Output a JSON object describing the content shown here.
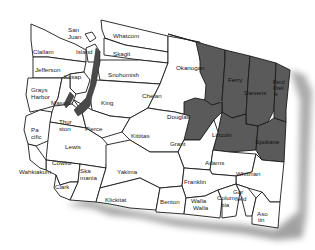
{
  "map": {
    "title": "Washington State Counties",
    "colors": {
      "highlighted": "#5a5a5a",
      "default": "#ffffff",
      "border": "#1a1a1a",
      "water": "#4a4a4a",
      "shadow": "#8a8a8a"
    },
    "highlighted_counties": [
      "Okanogan",
      "Ferry",
      "Stevens",
      "Pend Oreille",
      "Douglas",
      "Lincoln",
      "Spokane"
    ],
    "counties": [
      {
        "id": "san-juan",
        "label1": "San",
        "label2": "Juan",
        "highlighted": false
      },
      {
        "id": "whatcom",
        "label1": "Whatcom",
        "highlighted": false
      },
      {
        "id": "clallam",
        "label1": "Clallam",
        "highlighted": false
      },
      {
        "id": "island",
        "label1": "Island",
        "highlighted": false
      },
      {
        "id": "skagit",
        "label1": "Skagit",
        "highlighted": false
      },
      {
        "id": "okanogan",
        "label1": "Okanogan",
        "highlighted": true
      },
      {
        "id": "ferry",
        "label1": "Ferry",
        "highlighted": true
      },
      {
        "id": "stevens",
        "label1": "Stevens",
        "highlighted": true
      },
      {
        "id": "pend-oreille",
        "label1": "Pend",
        "label2": "Oreil",
        "label3": "le",
        "highlighted": true
      },
      {
        "id": "jefferson",
        "label1": "Jefferson",
        "highlighted": false
      },
      {
        "id": "kitsap",
        "label1": "Kitsap",
        "highlighted": false
      },
      {
        "id": "snohomish",
        "label1": "Snohomish",
        "highlighted": false
      },
      {
        "id": "chelan",
        "label1": "Chelan",
        "highlighted": false
      },
      {
        "id": "grays-harbor",
        "label1": "Grays",
        "label2": "Harbor",
        "highlighted": false
      },
      {
        "id": "mason",
        "label1": "Mason",
        "highlighted": false
      },
      {
        "id": "king",
        "label1": "King",
        "highlighted": false
      },
      {
        "id": "douglas",
        "label1": "Douglas",
        "highlighted": true
      },
      {
        "id": "lincoln",
        "label1": "Lincoln",
        "highlighted": true
      },
      {
        "id": "spokane",
        "label1": "Spokane",
        "highlighted": true
      },
      {
        "id": "pacific",
        "label1": "Pa",
        "label2": "cific",
        "highlighted": false
      },
      {
        "id": "thurston",
        "label1": "Thur",
        "label2": "ston",
        "highlighted": false
      },
      {
        "id": "pierce",
        "label1": "Pierce",
        "highlighted": false
      },
      {
        "id": "kittitas",
        "label1": "Kittitas",
        "highlighted": false
      },
      {
        "id": "grant",
        "label1": "Grant",
        "highlighted": false
      },
      {
        "id": "lewis",
        "label1": "Lewis",
        "highlighted": false
      },
      {
        "id": "adams",
        "label1": "Adams",
        "highlighted": false
      },
      {
        "id": "whitman",
        "label1": "Whitman",
        "highlighted": false
      },
      {
        "id": "cowlitz",
        "label1": "Cowlitz",
        "highlighted": false
      },
      {
        "id": "wahkiakum",
        "label1": "Wahkiakum",
        "highlighted": false
      },
      {
        "id": "skamania",
        "label1": "Ska",
        "label2": "mania",
        "highlighted": false
      },
      {
        "id": "yakima",
        "label1": "Yakima",
        "highlighted": false
      },
      {
        "id": "franklin",
        "label1": "Franklin",
        "highlighted": false
      },
      {
        "id": "clark",
        "label1": "Clark",
        "highlighted": false
      },
      {
        "id": "klickitat",
        "label1": "Klickitat",
        "highlighted": false
      },
      {
        "id": "benton",
        "label1": "Benton",
        "highlighted": false
      },
      {
        "id": "walla-walla",
        "label1": "Walla",
        "label2": "Walla",
        "highlighted": false
      },
      {
        "id": "columbia",
        "label1": "Colum",
        "label2": "bia",
        "highlighted": false
      },
      {
        "id": "garfield",
        "label1": "Gar",
        "label2": "field",
        "highlighted": false
      },
      {
        "id": "asotin",
        "label1": "Aso",
        "label2": "tin",
        "highlighted": false
      }
    ]
  }
}
